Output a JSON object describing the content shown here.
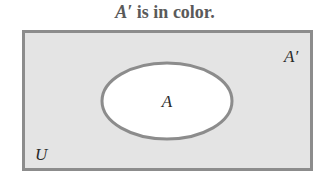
{
  "title": {
    "symbol": "A′",
    "text": " is in color."
  },
  "diagram": {
    "type": "venn",
    "universe_label": "U",
    "set_label": "A",
    "complement_label": "A′",
    "shaded_region": "A′",
    "colors": {
      "shaded_fill": "#e4e4e4",
      "set_fill": "#ffffff",
      "stroke": "#8c8c8c"
    }
  }
}
